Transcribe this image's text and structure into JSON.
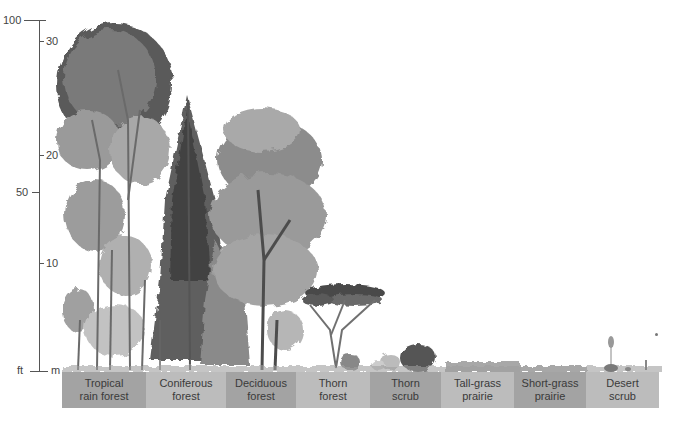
{
  "axis": {
    "feet_ticks": [
      {
        "label": "100",
        "y": 20
      },
      {
        "label": "50",
        "y": 192
      }
    ],
    "meter_ticks": [
      {
        "label": "30",
        "y": 41
      },
      {
        "label": "20",
        "y": 155
      },
      {
        "label": "10",
        "y": 263
      }
    ],
    "base": {
      "feet_unit": "ft",
      "meter_unit": "m",
      "y": 370
    }
  },
  "biomes": [
    {
      "line1": "Tropical",
      "line2": "rain forest",
      "x": 62,
      "w": 84,
      "shade": "dark"
    },
    {
      "line1": "Coniferous",
      "line2": "forest",
      "x": 146,
      "w": 80,
      "shade": "light"
    },
    {
      "line1": "Deciduous",
      "line2": "forest",
      "x": 226,
      "w": 70,
      "shade": "dark"
    },
    {
      "line1": "Thorn",
      "line2": "forest",
      "x": 296,
      "w": 74,
      "shade": "light"
    },
    {
      "line1": "Thorn",
      "line2": "scrub",
      "x": 370,
      "w": 71,
      "shade": "dark"
    },
    {
      "line1": "Tall-grass",
      "line2": "prairie",
      "x": 441,
      "w": 73,
      "shade": "light"
    },
    {
      "line1": "Short-grass",
      "line2": "prairie",
      "x": 514,
      "w": 72,
      "shade": "dark"
    },
    {
      "line1": "Desert",
      "line2": "scrub",
      "x": 586,
      "w": 73,
      "shade": "light"
    }
  ],
  "colors": {
    "band_dark": "#a3a3a3",
    "band_light": "#bcbcbc",
    "foliage_dark": "#4a4a4a",
    "foliage_mid": "#8a8a8a",
    "foliage_light": "#c4c4c4"
  }
}
